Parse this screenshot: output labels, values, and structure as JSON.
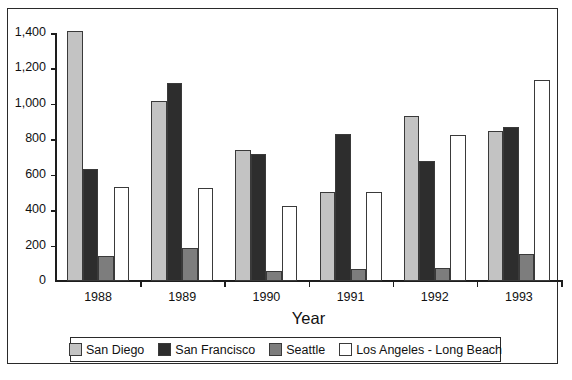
{
  "chart_data": {
    "type": "bar",
    "title": "",
    "xlabel": "Year",
    "ylabel": "",
    "categories": [
      "1988",
      "1989",
      "1990",
      "1991",
      "1992",
      "1993"
    ],
    "series": [
      {
        "name": "San Diego",
        "color": "#c3c3c3",
        "values": [
          1410,
          1015,
          740,
          505,
          930,
          845
        ]
      },
      {
        "name": "San Francisco",
        "color": "#2d2d2d",
        "values": [
          630,
          1120,
          715,
          830,
          675,
          870
        ]
      },
      {
        "name": "Seattle",
        "color": "#7d7d7d",
        "values": [
          140,
          185,
          55,
          70,
          75,
          155
        ]
      },
      {
        "name": "Los Angeles - Long Beach",
        "color": "#ffffff",
        "values": [
          530,
          525,
          425,
          500,
          825,
          1135
        ]
      }
    ],
    "ylim": [
      0,
      1400
    ],
    "ytick_labels": [
      "1,400",
      "1,200",
      "1,000",
      "800",
      "600",
      "400",
      "200",
      "0"
    ],
    "ytick_values": [
      1400,
      1200,
      1000,
      800,
      600,
      400,
      200,
      0
    ],
    "grid": false,
    "legend_position": "bottom"
  },
  "axis": {
    "x_title": "Year"
  },
  "legend": {
    "entries": [
      {
        "label": "San Diego",
        "swatch": "#c3c3c3"
      },
      {
        "label": "San Francisco",
        "swatch": "#2d2d2d"
      },
      {
        "label": "Seattle",
        "swatch": "#7d7d7d"
      },
      {
        "label": "Los Angeles - Long Beach",
        "swatch": "#ffffff"
      }
    ]
  }
}
